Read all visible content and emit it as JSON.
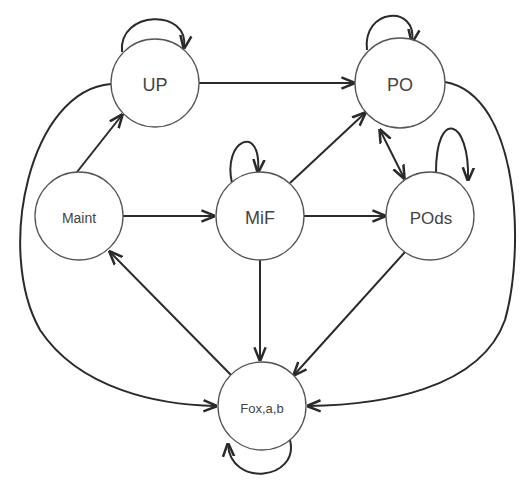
{
  "diagram": {
    "type": "state-transition-diagram",
    "nodes": [
      {
        "id": "UP",
        "label": "UP",
        "cx": 155,
        "cy": 83,
        "r": 44,
        "font_size": 18
      },
      {
        "id": "PO",
        "label": "PO",
        "cx": 400,
        "cy": 83,
        "r": 45,
        "font_size": 18
      },
      {
        "id": "Maint",
        "label": "Maint",
        "cx": 79,
        "cy": 216,
        "r": 44,
        "font_size": 14
      },
      {
        "id": "MiF",
        "label": "MiF",
        "cx": 260,
        "cy": 216,
        "r": 44,
        "font_size": 18
      },
      {
        "id": "POds",
        "label": "POds",
        "cx": 430,
        "cy": 216,
        "r": 44,
        "font_size": 17
      },
      {
        "id": "Fox",
        "label": "Fox,a,b",
        "cx": 262,
        "cy": 406,
        "r": 44,
        "font_size": 13
      }
    ],
    "edges": [
      {
        "from": "UP",
        "to": "UP",
        "kind": "self-loop"
      },
      {
        "from": "PO",
        "to": "PO",
        "kind": "self-loop"
      },
      {
        "from": "MiF",
        "to": "MiF",
        "kind": "self-loop"
      },
      {
        "from": "POds",
        "to": "POds",
        "kind": "self-loop"
      },
      {
        "from": "Fox",
        "to": "Fox",
        "kind": "self-loop"
      },
      {
        "from": "UP",
        "to": "PO"
      },
      {
        "from": "Maint",
        "to": "UP"
      },
      {
        "from": "Maint",
        "to": "MiF"
      },
      {
        "from": "MiF",
        "to": "PO"
      },
      {
        "from": "MiF",
        "to": "POds"
      },
      {
        "from": "MiF",
        "to": "Fox"
      },
      {
        "from": "PO",
        "to": "POds",
        "bidirectional": true
      },
      {
        "from": "POds",
        "to": "Fox"
      },
      {
        "from": "Fox",
        "to": "Maint"
      },
      {
        "from": "UP",
        "to": "Fox",
        "kind": "outer-curve-left"
      },
      {
        "from": "PO",
        "to": "Fox",
        "kind": "outer-curve-right"
      }
    ]
  }
}
